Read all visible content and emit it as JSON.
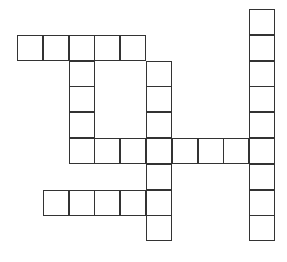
{
  "puzzle": {
    "type": "crossword",
    "origin": {
      "x": 18,
      "y": 10
    },
    "cell_size": 25.8,
    "border_color": "#333333",
    "cells": [
      [
        0,
        9
      ],
      [
        1,
        0
      ],
      [
        1,
        1
      ],
      [
        1,
        2
      ],
      [
        1,
        3
      ],
      [
        1,
        4
      ],
      [
        1,
        9
      ],
      [
        2,
        2
      ],
      [
        2,
        5
      ],
      [
        2,
        9
      ],
      [
        3,
        2
      ],
      [
        3,
        5
      ],
      [
        3,
        9
      ],
      [
        4,
        2
      ],
      [
        4,
        5
      ],
      [
        4,
        9
      ],
      [
        5,
        2
      ],
      [
        5,
        3
      ],
      [
        5,
        4
      ],
      [
        5,
        5
      ],
      [
        5,
        6
      ],
      [
        5,
        7
      ],
      [
        5,
        8
      ],
      [
        5,
        9
      ],
      [
        6,
        5
      ],
      [
        6,
        9
      ],
      [
        7,
        1
      ],
      [
        7,
        2
      ],
      [
        7,
        3
      ],
      [
        7,
        4
      ],
      [
        7,
        5
      ],
      [
        7,
        9
      ],
      [
        8,
        5
      ],
      [
        8,
        9
      ]
    ]
  }
}
